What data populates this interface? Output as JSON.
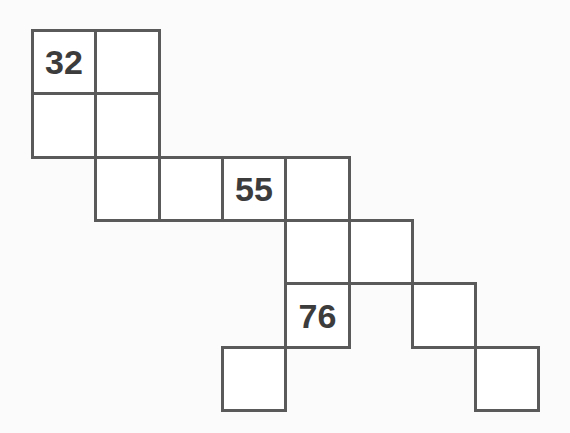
{
  "puzzle": {
    "type": "number-path-grid",
    "origin": {
      "x": 32,
      "y": 30
    },
    "cell_size": 63.3,
    "line_color": "#5a5a5a",
    "number_color": "#3c3c3c",
    "cells": [
      {
        "col": 0,
        "row": 0,
        "value": "32"
      },
      {
        "col": 1,
        "row": 0,
        "value": ""
      },
      {
        "col": 0,
        "row": 1,
        "value": ""
      },
      {
        "col": 1,
        "row": 1,
        "value": ""
      },
      {
        "col": 1,
        "row": 2,
        "value": ""
      },
      {
        "col": 2,
        "row": 2,
        "value": ""
      },
      {
        "col": 3,
        "row": 2,
        "value": "55"
      },
      {
        "col": 4,
        "row": 2,
        "value": ""
      },
      {
        "col": 4,
        "row": 3,
        "value": ""
      },
      {
        "col": 5,
        "row": 3,
        "value": ""
      },
      {
        "col": 4,
        "row": 4,
        "value": "76"
      },
      {
        "col": 6,
        "row": 4,
        "value": ""
      },
      {
        "col": 3,
        "row": 5,
        "value": ""
      },
      {
        "col": 7,
        "row": 5,
        "value": ""
      }
    ]
  }
}
